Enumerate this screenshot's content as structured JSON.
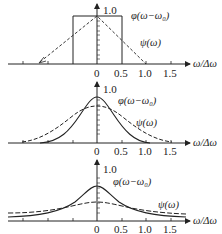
{
  "figure": {
    "x_axis_label": "ω/Δω",
    "y_max_label": "1.0",
    "x_ticks": [
      "0",
      "0.5",
      "1.0",
      "1.5"
    ],
    "curve_labels": {
      "phi": "φ(ω−ω₀)",
      "psi": "ψ(ω)"
    }
  },
  "panels": [
    {
      "id": "panel-1",
      "phi_shape": "rectangle",
      "psi_shape": "triangle",
      "phi_label": "φ(ω−ω₀)",
      "psi_label": "ψ(ω)",
      "ticks": [
        "0",
        "0.5",
        "1.0",
        "1.5"
      ],
      "y_label": "1.0",
      "x_label": "ω/Δω"
    },
    {
      "id": "panel-2",
      "phi_shape": "gaussian",
      "psi_shape": "gaussian-broad",
      "phi_label": "φ(ω−ω₀)",
      "psi_label": "ψ(ω)",
      "ticks": [
        "0",
        "0.5",
        "1.0",
        "1.5"
      ],
      "y_label": "1.0",
      "x_label": "ω/Δω"
    },
    {
      "id": "panel-3",
      "phi_shape": "lorentzian",
      "psi_shape": "lorentzian-broad",
      "phi_label": "φ(ω−ω₀)",
      "psi_label": "ψ(ω)",
      "ticks": [
        "0",
        "0.5",
        "1.0",
        "1.5"
      ],
      "y_label": "1.0",
      "x_label": "ω/Δω"
    }
  ],
  "colors": {
    "line": "#222222",
    "background": "#ffffff"
  }
}
